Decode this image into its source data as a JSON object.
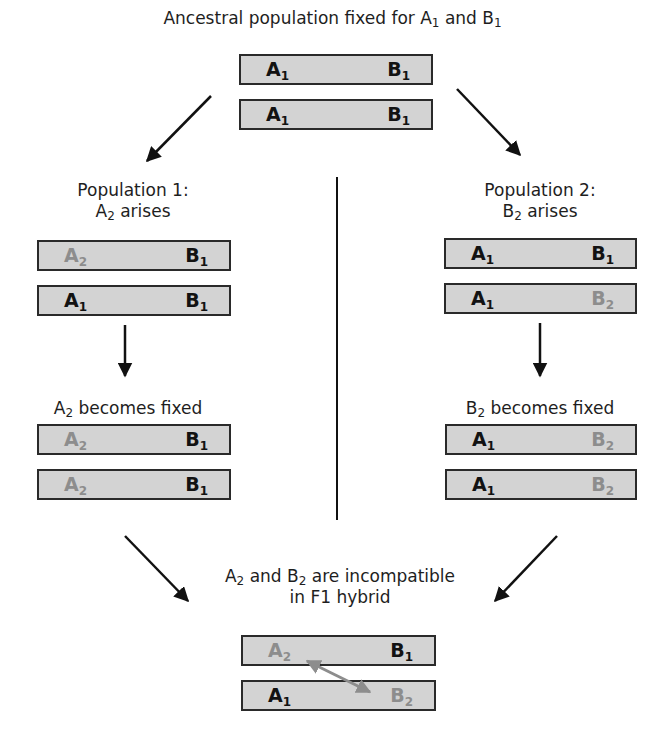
{
  "title": {
    "text": "Ancestral population fixed for A",
    "sub1": "1",
    "mid": " and B",
    "sub2": "1"
  },
  "colors": {
    "chromosome_fill": "#d3d3d3",
    "chromosome_border": "#2a2a2a",
    "ancestral_allele": "#121212",
    "derived_allele": "#8d8d8d",
    "arrow": "#111111",
    "incompatibility_arrow": "#8d8d8d"
  },
  "ancestral": {
    "chromosomes": [
      {
        "left": {
          "letter": "A",
          "sub": "1"
        },
        "right": {
          "letter": "B",
          "sub": "1"
        }
      },
      {
        "left": {
          "letter": "A",
          "sub": "1"
        },
        "right": {
          "letter": "B",
          "sub": "1"
        }
      }
    ]
  },
  "population1": {
    "heading_line1": "Population 1:",
    "heading_letter": "A",
    "heading_sub": "2",
    "heading_rest": " arises",
    "arises_chromosomes": [
      {
        "left": {
          "letter": "A",
          "sub": "2"
        },
        "right": {
          "letter": "B",
          "sub": "1"
        }
      },
      {
        "left": {
          "letter": "A",
          "sub": "1"
        },
        "right": {
          "letter": "B",
          "sub": "1"
        }
      }
    ],
    "fixed_letter": "A",
    "fixed_sub": "2",
    "fixed_rest": " becomes fixed",
    "fixed_chromosomes": [
      {
        "left": {
          "letter": "A",
          "sub": "2"
        },
        "right": {
          "letter": "B",
          "sub": "1"
        }
      },
      {
        "left": {
          "letter": "A",
          "sub": "2"
        },
        "right": {
          "letter": "B",
          "sub": "1"
        }
      }
    ]
  },
  "population2": {
    "heading_line1": "Population 2:",
    "heading_letter": "B",
    "heading_sub": "2",
    "heading_rest": " arises",
    "arises_chromosomes": [
      {
        "left": {
          "letter": "A",
          "sub": "1"
        },
        "right": {
          "letter": "B",
          "sub": "1"
        }
      },
      {
        "left": {
          "letter": "A",
          "sub": "1"
        },
        "right": {
          "letter": "B",
          "sub": "2"
        }
      }
    ],
    "fixed_letter": "B",
    "fixed_sub": "2",
    "fixed_rest": " becomes fixed",
    "fixed_chromosomes": [
      {
        "left": {
          "letter": "A",
          "sub": "1"
        },
        "right": {
          "letter": "B",
          "sub": "2"
        }
      },
      {
        "left": {
          "letter": "A",
          "sub": "1"
        },
        "right": {
          "letter": "B",
          "sub": "2"
        }
      }
    ]
  },
  "hybrid": {
    "caption_a": "A",
    "caption_a_sub": "2",
    "caption_mid": " and B",
    "caption_b_sub": "2",
    "caption_rest": " are incompatible",
    "caption_line2": "in F1 hybrid",
    "chromosomes": [
      {
        "left": {
          "letter": "A",
          "sub": "2"
        },
        "right": {
          "letter": "B",
          "sub": "1"
        }
      },
      {
        "left": {
          "letter": "A",
          "sub": "1"
        },
        "right": {
          "letter": "B",
          "sub": "2"
        }
      }
    ]
  }
}
